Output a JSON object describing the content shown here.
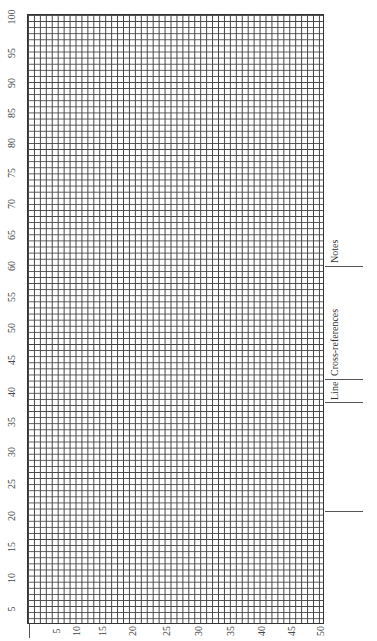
{
  "grid": {
    "rows": 100,
    "columns": 50,
    "line_color": "#444444"
  },
  "y_axis_labels": [
    "100",
    "95",
    "90",
    "85",
    "80",
    "75",
    "70",
    "65",
    "60",
    "55",
    "50",
    "45",
    "40",
    "35",
    "30",
    "25",
    "20",
    "15",
    "10",
    "5"
  ],
  "x_axis_labels": [
    "5",
    "10",
    "15",
    "20",
    "25",
    "30",
    "35",
    "40",
    "45",
    "50"
  ],
  "margin_labels": {
    "notes": "Notes",
    "cross_references": "Cross-references",
    "line": "Line"
  }
}
